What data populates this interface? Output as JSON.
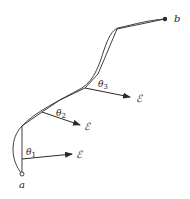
{
  "diagram": {
    "labels": {
      "start_point": "a",
      "end_point": "b",
      "angles": [
        "θ1",
        "θ2",
        "θ3"
      ],
      "angle_base": "θ",
      "angle_subscripts": [
        "1",
        "2",
        "3"
      ],
      "field_symbol": "ℰ"
    },
    "colors": {
      "stroke": "#2a2a2a",
      "background": "#ffffff"
    }
  }
}
